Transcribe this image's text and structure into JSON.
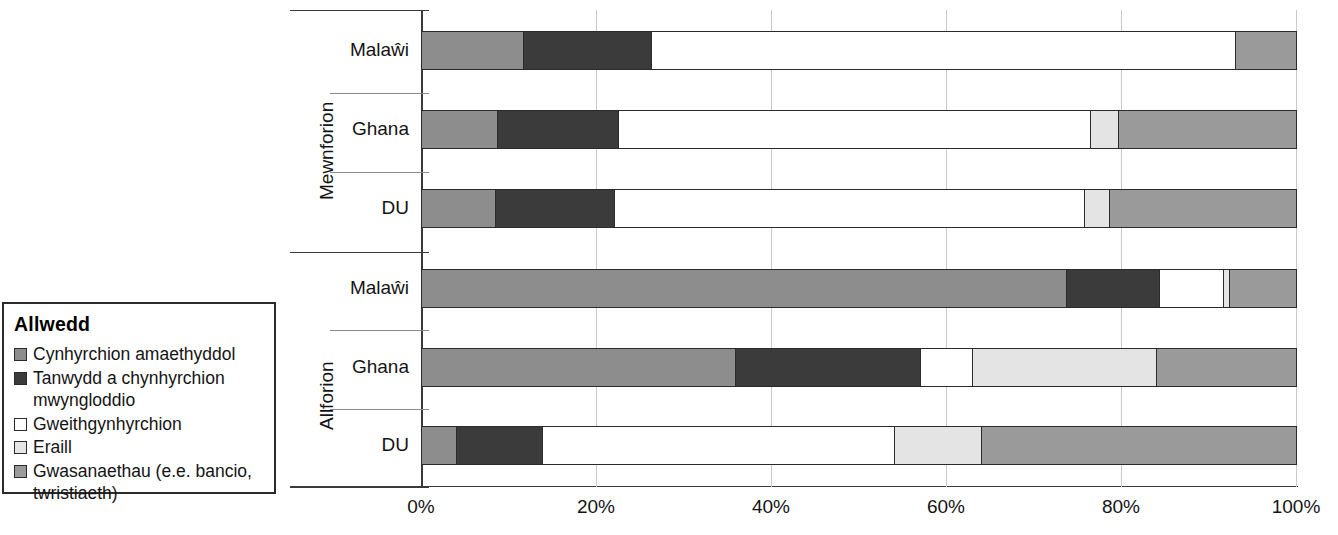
{
  "legend": {
    "title": "Allwedd",
    "items": [
      {
        "label": "Cynhyrchion amaethyddol",
        "color": "#8d8d8d",
        "key": "agricultural"
      },
      {
        "label": "Tanwydd a chynhyrchion\nmwyngloddio",
        "color": "#3b3b3b",
        "key": "fuel-mining"
      },
      {
        "label": "Gweithgynhyrchion",
        "color": "#ffffff",
        "key": "manufactures"
      },
      {
        "label": "Eraill",
        "color": "#e4e4e4",
        "key": "other"
      },
      {
        "label": "Gwasanaethau (e.e. bancio,\ntwristiaeth)",
        "color": "#9a9a9a",
        "key": "services"
      }
    ]
  },
  "axis": {
    "x_ticks": [
      "0%",
      "20%",
      "40%",
      "60%",
      "80%",
      "100%"
    ],
    "x_values": [
      0,
      20,
      40,
      60,
      80,
      100
    ],
    "group_labels": [
      "Mewnforion",
      "Allforion"
    ],
    "category_labels": [
      "Malaŵi",
      "Ghana",
      "DU"
    ]
  },
  "chart_data": {
    "type": "bar",
    "orientation": "horizontal",
    "stacked": "percent",
    "title": "",
    "xlabel": "",
    "ylabel": "",
    "xlim": [
      0,
      100
    ],
    "grid": true,
    "legend_position": "left",
    "series": [
      {
        "name": "Cynhyrchion amaethyddol",
        "color": "#8d8d8d"
      },
      {
        "name": "Tanwydd a chynhyrchion mwyngloddio",
        "color": "#3b3b3b"
      },
      {
        "name": "Gweithgynhyrchion",
        "color": "#ffffff"
      },
      {
        "name": "Eraill",
        "color": "#e4e4e4"
      },
      {
        "name": "Gwasanaethau (e.e. bancio, twristiaeth)",
        "color": "#9a9a9a"
      }
    ],
    "groups": [
      {
        "name": "Mewnforion",
        "bars": [
          {
            "category": "Malaŵi",
            "values": [
              11.7,
              14.6,
              66.7,
              0.0,
              7.0
            ]
          },
          {
            "category": "Ghana",
            "values": [
              8.7,
              13.8,
              54.0,
              3.2,
              20.3
            ]
          },
          {
            "category": "DU",
            "values": [
              8.5,
              13.5,
              53.8,
              2.8,
              21.4
            ]
          }
        ]
      },
      {
        "name": "Allforion",
        "bars": [
          {
            "category": "Malaŵi",
            "values": [
              73.7,
              10.6,
              7.4,
              0.6,
              7.7
            ]
          },
          {
            "category": "Ghana",
            "values": [
              35.9,
              21.1,
              6.0,
              21.0,
              16.0
            ]
          },
          {
            "category": "DU",
            "values": [
              4.0,
              9.8,
              40.2,
              10.0,
              36.0
            ]
          }
        ]
      }
    ]
  }
}
